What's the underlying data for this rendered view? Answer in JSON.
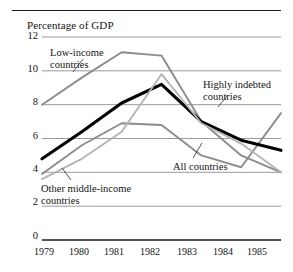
{
  "chart_data": {
    "type": "line",
    "title": "",
    "ylabel": "Percentage of GDP",
    "xlabel": "",
    "x": [
      "1979",
      "1980",
      "1981",
      "1982",
      "1983",
      "1984",
      "1985"
    ],
    "ylim": [
      0,
      12
    ],
    "yticks": [
      "0",
      "2",
      "4",
      "6",
      "8",
      "10",
      "12"
    ],
    "grid": "horizontal",
    "legend": "inline-annotations",
    "series": [
      {
        "name": "Low-income countries",
        "color": "#8c8c8c",
        "values": [
          8.0,
          9.6,
          11.1,
          10.9,
          7.0,
          5.0,
          4.0
        ]
      },
      {
        "name": "Highly indebted countries",
        "color": "#8c8c8c",
        "values": [
          3.9,
          5.6,
          6.9,
          6.8,
          5.0,
          4.3,
          7.5
        ]
      },
      {
        "name": "All countries",
        "color": "#000000",
        "values": [
          4.8,
          6.4,
          8.1,
          9.2,
          7.0,
          5.9,
          5.3
        ]
      },
      {
        "name": "Other middle-income countries",
        "color": "#b5b5b5",
        "values": [
          3.6,
          4.8,
          6.4,
          9.8,
          6.9,
          5.7,
          4.0
        ]
      }
    ],
    "annotations": [
      {
        "id": "low-income",
        "label_line1": "Low-income",
        "label_line2": "countries"
      },
      {
        "id": "highly-indebted",
        "label_line1": "Highly indebted",
        "label_line2": "countries"
      },
      {
        "id": "all-countries",
        "label_line1": "All countries",
        "label_line2": ""
      },
      {
        "id": "other-middle-income",
        "label_line1": "Other middle-income",
        "label_line2": "countries"
      }
    ]
  }
}
